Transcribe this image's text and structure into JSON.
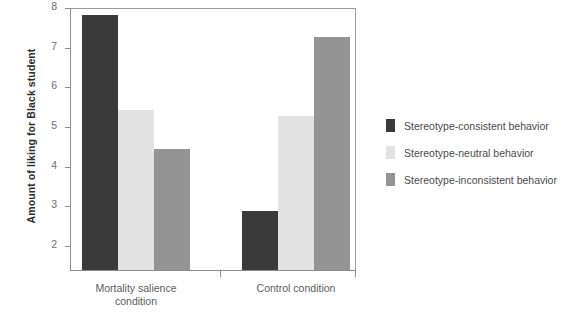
{
  "chart_data": {
    "type": "bar",
    "title": "",
    "subtitle": "",
    "xlabel": "",
    "ylabel": "Amount of liking for Black student",
    "categories": [
      "Mortality salience condition",
      "Control condition"
    ],
    "category_lines": [
      [
        "Mortality salience",
        "condition"
      ],
      [
        "Control condition"
      ]
    ],
    "ylim": [
      1.4,
      8
    ],
    "yticks": [
      2,
      3,
      4,
      5,
      6,
      7,
      8
    ],
    "ytick_labels": [
      "2",
      "3",
      "4",
      "5",
      "6",
      "7",
      "8"
    ],
    "grid": false,
    "legend_position": "right",
    "series": [
      {
        "name": "Stereotype-consistent behavior",
        "color": "#3a3a3a",
        "values": [
          7.82,
          2.88
        ]
      },
      {
        "name": "Stereotype-neutral behavior",
        "color": "#e2e2e2",
        "values": [
          5.43,
          5.29
        ]
      },
      {
        "name": "Stereotype-inconsistent behavior",
        "color": "#949494",
        "values": [
          4.45,
          7.27
        ]
      }
    ]
  },
  "legend": {
    "items": [
      {
        "label": "Stereotype-consistent behavior",
        "color": "#3a3a3a",
        "swatch_name": "legend-swatch-consistent"
      },
      {
        "label": "Stereotype-neutral behavior",
        "color": "#e2e2e2",
        "swatch_name": "legend-swatch-neutral"
      },
      {
        "label": "Stereotype-inconsistent behavior",
        "color": "#949494",
        "swatch_name": "legend-swatch-inconsistent"
      }
    ]
  },
  "axes": {
    "y_title": "Amount of liking for Black student",
    "axis_color": "#8c8c8c",
    "tick_label_color": "#6f6f6f"
  }
}
